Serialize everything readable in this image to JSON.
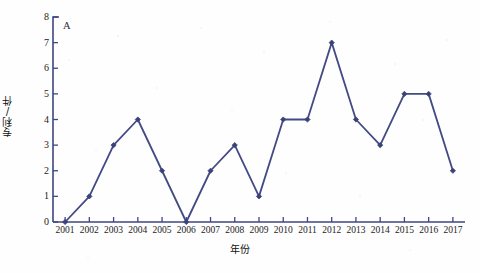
{
  "panel_label": "A",
  "colors": {
    "line": "#434a84",
    "marker": "#3b4278",
    "axis": "#3f4680",
    "text": "#1c1c1c",
    "background": "#fefefe"
  },
  "chart_data": {
    "type": "line",
    "title": "",
    "xlabel": "年份",
    "ylabel": "专利/件",
    "categories": [
      "2001",
      "2002",
      "2003",
      "2004",
      "2005",
      "2006",
      "2007",
      "2008",
      "2009",
      "2010",
      "2011",
      "2012",
      "2013",
      "2014",
      "2015",
      "2016",
      "2017"
    ],
    "values": [
      0,
      1,
      3,
      4,
      2,
      0,
      2,
      3,
      1,
      4,
      4,
      7,
      4,
      3,
      5,
      5,
      2
    ],
    "ylim": [
      0,
      8
    ],
    "ytick_labels": [
      "0",
      "1",
      "2",
      "3",
      "4",
      "5",
      "6",
      "7",
      "8"
    ],
    "yticks": [
      0,
      1,
      2,
      3,
      4,
      5,
      6,
      7,
      8
    ],
    "grid": false,
    "legend": null,
    "markers": "diamond"
  }
}
